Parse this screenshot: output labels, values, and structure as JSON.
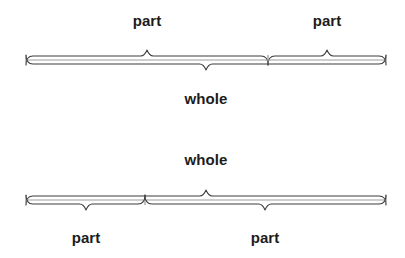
{
  "canvas": {
    "width": 405,
    "height": 258,
    "background": "#ffffff"
  },
  "colors": {
    "brace": "#3c3c3c",
    "line": "#9e9e9e",
    "tick": "#8a8a8a",
    "text": "#1c1c1c"
  },
  "chart_data": {
    "type": "bar",
    "title": "",
    "xlabel": "",
    "ylabel": "",
    "diagrams": [
      {
        "name": "diagram-top",
        "bar": {
          "x_start": 26,
          "x_end": 386,
          "y": 60,
          "split": 268
        },
        "top_braces": [
          {
            "label": "part",
            "from": 26,
            "to": 268,
            "peak": 147
          },
          {
            "label": "part",
            "from": 268,
            "to": 386,
            "peak": 327
          }
        ],
        "bottom_braces": [
          {
            "label": "whole",
            "from": 26,
            "to": 386,
            "peak": 206
          }
        ]
      },
      {
        "name": "diagram-bottom",
        "bar": {
          "x_start": 26,
          "x_end": 386,
          "y": 200,
          "split": 145
        },
        "top_braces": [
          {
            "label": "whole",
            "from": 26,
            "to": 386,
            "peak": 206
          }
        ],
        "bottom_braces": [
          {
            "label": "part",
            "from": 26,
            "to": 145,
            "peak": 86
          },
          {
            "label": "part",
            "from": 145,
            "to": 386,
            "peak": 265
          }
        ]
      }
    ]
  },
  "labels": {
    "top_left_part": "part",
    "top_right_part": "part",
    "top_whole": "whole",
    "bottom_whole": "whole",
    "bottom_left_part": "part",
    "bottom_right_part": "part"
  }
}
